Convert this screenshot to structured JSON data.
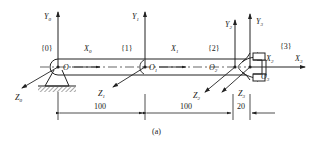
{
  "diagram": {
    "type": "robot-arm-coordinate-frames",
    "caption": "(a)",
    "frames": [
      {
        "label": "{0}",
        "origin": "O",
        "x_axis": "X",
        "x_sub": "0",
        "y_axis": "Y",
        "y_sub": "0",
        "z_axis": "Z",
        "z_sub": "0"
      },
      {
        "label": "{1}",
        "origin": "O",
        "origin_sub": "1",
        "x_axis": "X",
        "x_sub": "1",
        "y_axis": "Y",
        "y_sub": "1",
        "z_axis": "Z",
        "z_sub": "1"
      },
      {
        "label": "{2}",
        "origin": "O",
        "origin_sub": "2",
        "x_axis": "X",
        "x_sub": "2",
        "y_axis": "Y",
        "y_sub": "2",
        "z_axis": "Z",
        "z_sub": "2"
      },
      {
        "label": "{3}",
        "origin": "O",
        "origin_sub": "3",
        "x_axis": "X",
        "x_sub": "3",
        "y_axis": "Y",
        "y_sub": "3",
        "z_axis": "Z",
        "z_sub": "3"
      }
    ],
    "dimensions": [
      "100",
      "100",
      "20"
    ]
  }
}
